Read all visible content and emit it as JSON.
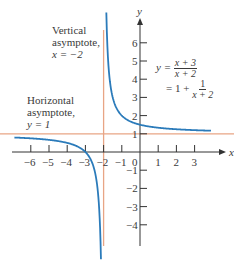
{
  "chart_data": {
    "type": "line",
    "title": "",
    "function": "y = (x+3)/(x+2) = 1 + 1/(x+2)",
    "xlabel": "x",
    "ylabel": "y",
    "xlim": [
      -6.9,
      3.9
    ],
    "ylim": [
      -5,
      7
    ],
    "x_ticks": [
      -6,
      -5,
      -4,
      -3,
      -2,
      -1,
      0,
      1,
      2,
      3
    ],
    "y_ticks": [
      -4,
      -3,
      -2,
      -1,
      1,
      2,
      3,
      4,
      5,
      6
    ],
    "asymptotes": {
      "vertical": -2,
      "horizontal": 1
    },
    "series": [
      {
        "name": "left branch",
        "x": [
          -6.9,
          -6,
          -5,
          -4,
          -3,
          -2.5,
          -2.2,
          -2.15
        ],
        "y": [
          0.796,
          0.75,
          0.667,
          0.5,
          0,
          -1,
          -4,
          -5.67
        ]
      },
      {
        "name": "right branch",
        "x": [
          -1.85,
          -1.8,
          -1.5,
          -1,
          0,
          1,
          2,
          3,
          3.9
        ],
        "y": [
          7.67,
          6,
          3,
          2,
          1.5,
          1.333,
          1.25,
          1.2,
          1.169
        ]
      }
    ],
    "colors": {
      "curve": "#2b7bba",
      "asymptote": "#e8a585",
      "axis": "#333333"
    },
    "annotations": [
      {
        "text": "Vertical asymptote, x = −2"
      },
      {
        "text": "Horizontal asymptote, y = 1"
      },
      {
        "text": "y = (x + 3)/(x + 2) = 1 + 1/(x + 2)"
      }
    ]
  },
  "labels": {
    "vertical_line1": "Vertical",
    "vertical_line2": "asymptote,",
    "vertical_line3": "x = −2",
    "horizontal_line1": "Horizontal",
    "horizontal_line2": "asymptote,",
    "horizontal_line3": "y = 1",
    "eq_lhs": "y =",
    "eq_num": "x + 3",
    "eq_den": "x + 2",
    "eq2_lhs": "= 1 +",
    "eq2_num": "1",
    "eq2_den": "x + 2",
    "axis_x": "x",
    "axis_y": "y",
    "origin": "0"
  }
}
